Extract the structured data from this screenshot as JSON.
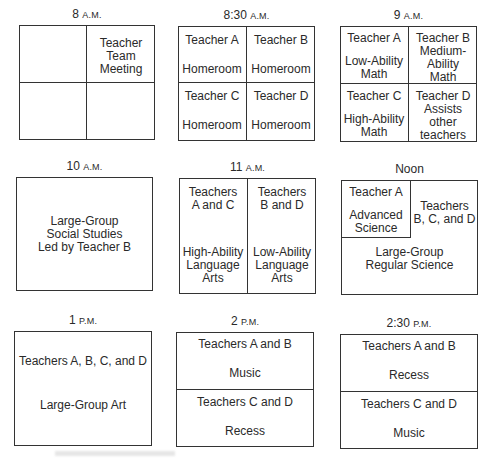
{
  "schedule": {
    "slots": [
      {
        "time": "8",
        "ampm": "A.M.",
        "cells": [
          {
            "pos": "top-left",
            "lines": []
          },
          {
            "pos": "top-right",
            "lines": [
              "Teacher",
              "Team",
              "Meeting"
            ]
          },
          {
            "pos": "bottom-left",
            "lines": []
          },
          {
            "pos": "bottom-right",
            "lines": []
          }
        ]
      },
      {
        "time": "8:30",
        "ampm": "A.M.",
        "cells": [
          {
            "pos": "top-left",
            "teacher": "Teacher A",
            "activity": "Homeroom"
          },
          {
            "pos": "top-right",
            "teacher": "Teacher B",
            "activity": "Homeroom"
          },
          {
            "pos": "bottom-left",
            "teacher": "Teacher C",
            "activity": "Homeroom"
          },
          {
            "pos": "bottom-right",
            "teacher": "Teacher D",
            "activity": "Homeroom"
          }
        ]
      },
      {
        "time": "9",
        "ampm": "A.M.",
        "cells": [
          {
            "pos": "top-left",
            "teacher": "Teacher A",
            "activity": [
              "Low-Ability",
              "Math"
            ]
          },
          {
            "pos": "top-right",
            "teacher": "Teacher B",
            "activity": [
              "Medium-",
              "Ability",
              "Math"
            ]
          },
          {
            "pos": "bottom-left",
            "teacher": "Teacher C",
            "activity": [
              "High-Ability",
              "Math"
            ]
          },
          {
            "pos": "bottom-right",
            "teacher": "Teacher D",
            "activity": [
              "Assists other",
              "teachers"
            ]
          }
        ]
      },
      {
        "time": "10",
        "ampm": "A.M.",
        "cells": [
          {
            "pos": "full",
            "lines": [
              "Large-Group",
              "Social Studies",
              "Led by Teacher B"
            ]
          }
        ]
      },
      {
        "time": "11",
        "ampm": "A.M.",
        "cells": [
          {
            "pos": "left",
            "teacher": [
              "Teachers",
              "A and C"
            ],
            "activity": [
              "High-Ability",
              "Language",
              "Arts"
            ]
          },
          {
            "pos": "right",
            "teacher": [
              "Teachers",
              "B and D"
            ],
            "activity": [
              "Low-Ability",
              "Language",
              "Arts"
            ]
          }
        ]
      },
      {
        "time": "Noon",
        "ampm": "",
        "cells": [
          {
            "pos": "inset-top-left",
            "teacher": "Teacher A",
            "activity": [
              "Advanced",
              "Science"
            ]
          },
          {
            "pos": "right",
            "teacher": [
              "Teachers",
              "B, C, and D"
            ]
          },
          {
            "pos": "bottom",
            "activity": [
              "Large-Group",
              "Regular Science"
            ]
          }
        ]
      },
      {
        "time": "1",
        "ampm": "P.M.",
        "cells": [
          {
            "pos": "full",
            "teacher": "Teachers A, B, C, and D",
            "activity": "Large-Group Art"
          }
        ]
      },
      {
        "time": "2",
        "ampm": "P.M.",
        "cells": [
          {
            "pos": "top",
            "teacher": "Teachers A and B",
            "activity": "Music"
          },
          {
            "pos": "bottom",
            "teacher": "Teachers C and D",
            "activity": "Recess"
          }
        ]
      },
      {
        "time": "2:30",
        "ampm": "P.M.",
        "cells": [
          {
            "pos": "top",
            "teacher": "Teachers A and B",
            "activity": "Recess"
          },
          {
            "pos": "bottom",
            "teacher": "Teachers C and D",
            "activity": "Music"
          }
        ]
      }
    ]
  }
}
